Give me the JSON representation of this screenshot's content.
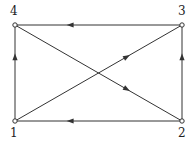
{
  "diagram": {
    "type": "directed-graph",
    "nodes": [
      {
        "id": "1",
        "label": "1",
        "x": 15,
        "y": 121
      },
      {
        "id": "2",
        "label": "2",
        "x": 182,
        "y": 121
      },
      {
        "id": "3",
        "label": "3",
        "x": 182,
        "y": 25
      },
      {
        "id": "4",
        "label": "4",
        "x": 15,
        "y": 25
      }
    ],
    "edges": [
      {
        "from": "1",
        "to": "4"
      },
      {
        "from": "2",
        "to": "1"
      },
      {
        "from": "2",
        "to": "3"
      },
      {
        "from": "3",
        "to": "4"
      },
      {
        "from": "1",
        "to": "3"
      },
      {
        "from": "4",
        "to": "2"
      }
    ],
    "colors": {
      "line": "#333333",
      "node_fill": "#ffffff"
    }
  }
}
